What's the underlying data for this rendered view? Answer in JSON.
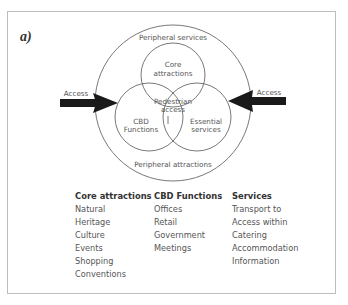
{
  "top_text": "Diagram (a) of the city-centre tourism model",
  "panel_label": "a)",
  "diagram": {
    "outer_top_label": "Peripheral services",
    "outer_bottom_label": "Peripheral attractions",
    "center_label_1": "Pedestrian",
    "center_label_2": "access",
    "top_circle_1": "Core",
    "top_circle_2": "attractions",
    "left_circle_1": "CBD",
    "left_circle_2": "Functions",
    "right_circle_1": "Essential",
    "right_circle_2": "services",
    "left_arrow_label": "Access",
    "right_arrow_label": "Access",
    "arrow_color": "#1a1a1a",
    "line_color": "#555555"
  },
  "legend": {
    "core": {
      "title": "Core attractions",
      "items": [
        "Natural",
        "Heritage",
        "Culture",
        "Events",
        "Shopping",
        "Conventions"
      ]
    },
    "cbd": {
      "title": "CBD Functions",
      "items": [
        "Offices",
        "Retail",
        "Government",
        "Meetings"
      ]
    },
    "services": {
      "title": "Services",
      "items": [
        "Transport to",
        "Access within",
        "Catering",
        "Accommodation",
        "Information"
      ]
    }
  }
}
